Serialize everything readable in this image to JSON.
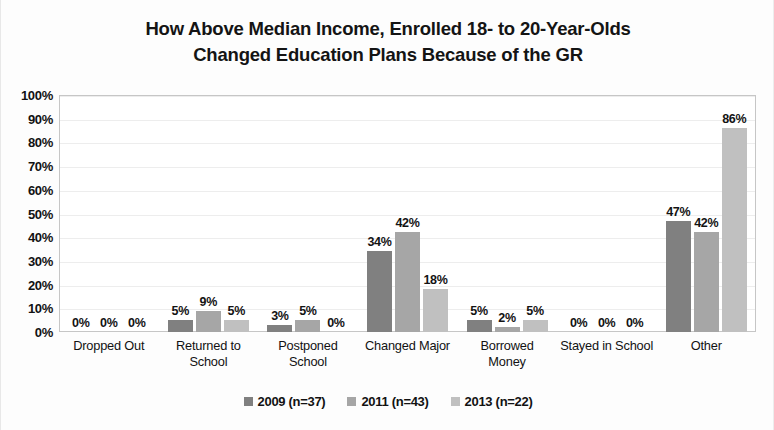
{
  "chart_data": {
    "type": "bar",
    "title": "How Above Median Income, Enrolled 18- to 20-Year-Olds Changed Education Plans Because of the GR",
    "title_line1": "How Above Median Income, Enrolled 18- to 20-Year-Olds",
    "title_line2": "Changed Education Plans Because of the GR",
    "xlabel": "",
    "ylabel": "",
    "ylim": [
      0,
      100
    ],
    "ytick_labels": [
      "100%",
      "90%",
      "80%",
      "70%",
      "60%",
      "50%",
      "40%",
      "30%",
      "20%",
      "10%",
      "0%"
    ],
    "ytick_values": [
      100,
      90,
      80,
      70,
      60,
      50,
      40,
      30,
      20,
      10,
      0
    ],
    "grid": true,
    "legend_position": "bottom",
    "categories": [
      "Dropped Out",
      "Returned to School",
      "Postponed School",
      "Changed Major",
      "Borrowed Money",
      "Stayed in School",
      "Other"
    ],
    "category_lines": [
      [
        "Dropped Out"
      ],
      [
        "Returned to",
        "School"
      ],
      [
        "Postponed",
        "School"
      ],
      [
        "Changed Major"
      ],
      [
        "Borrowed",
        "Money"
      ],
      [
        "Stayed in School"
      ],
      [
        "Other"
      ]
    ],
    "series": [
      {
        "name": "2009 (n=37)",
        "color": "#808080",
        "values": [
          0,
          5,
          3,
          34,
          5,
          0,
          47
        ],
        "labels": [
          "0%",
          "5%",
          "3%",
          "34%",
          "5%",
          "0%",
          "47%"
        ]
      },
      {
        "name": "2011 (n=43)",
        "color": "#a6a6a6",
        "values": [
          0,
          9,
          5,
          42,
          2,
          0,
          42
        ],
        "labels": [
          "0%",
          "9%",
          "5%",
          "42%",
          "2%",
          "0%",
          "42%"
        ]
      },
      {
        "name": "2013 (n=22)",
        "color": "#c0c0c0",
        "values": [
          0,
          5,
          0,
          18,
          5,
          0,
          86
        ],
        "labels": [
          "0%",
          "5%",
          "0%",
          "18%",
          "5%",
          "0%",
          "86%"
        ]
      }
    ]
  },
  "legend": {
    "items": [
      {
        "label": "2009 (n=37)",
        "color": "#808080"
      },
      {
        "label": "2011 (n=43)",
        "color": "#a6a6a6"
      },
      {
        "label": "2013 (n=22)",
        "color": "#c0c0c0"
      }
    ]
  }
}
